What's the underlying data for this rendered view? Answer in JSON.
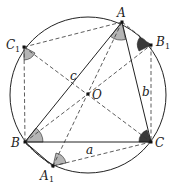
{
  "figure": {
    "colors": {
      "stroke": "#222222",
      "angle_light": "#b5b5b5",
      "angle_dark": "#3a3a3a",
      "background": "#ffffff"
    },
    "circle": {
      "cx": 88,
      "cy": 95,
      "r": 78
    },
    "points": {
      "A": {
        "label": "A",
        "sub": "",
        "x": 122,
        "y": 22
      },
      "B": {
        "label": "B",
        "sub": "",
        "x": 25,
        "y": 142
      },
      "C": {
        "label": "C",
        "sub": "",
        "x": 151,
        "y": 142
      },
      "O": {
        "label": "O",
        "sub": "",
        "x": 88,
        "y": 94
      },
      "A1": {
        "label": "A",
        "sub": "1",
        "x": 53,
        "y": 166
      },
      "B1": {
        "label": "B",
        "sub": "1",
        "x": 151,
        "y": 45
      },
      "C1": {
        "label": "C",
        "sub": "1",
        "x": 24,
        "y": 47
      }
    },
    "side_labels": {
      "a": "a",
      "b": "b",
      "c": "c"
    },
    "solid_segments": [
      [
        "A",
        "B"
      ],
      [
        "A",
        "C"
      ],
      [
        "B",
        "C"
      ],
      [
        "B",
        "A1"
      ]
    ],
    "dashed_segments": [
      [
        "C1",
        "A"
      ],
      [
        "C1",
        "B"
      ],
      [
        "C1",
        "C"
      ],
      [
        "A",
        "A1"
      ],
      [
        "B",
        "O"
      ],
      [
        "O",
        "B1"
      ],
      [
        "A",
        "B1"
      ],
      [
        "B1",
        "C"
      ],
      [
        "A1",
        "C"
      ],
      [
        "B",
        "A1"
      ]
    ],
    "shaded_angles": [
      {
        "vertex": "A",
        "shade": "light"
      },
      {
        "vertex": "B",
        "shade": "light"
      },
      {
        "vertex": "C",
        "shade": "dark"
      },
      {
        "vertex": "A1",
        "shade": "light"
      },
      {
        "vertex": "B1",
        "shade": "dark"
      },
      {
        "vertex": "C1",
        "shade": "light"
      }
    ]
  }
}
